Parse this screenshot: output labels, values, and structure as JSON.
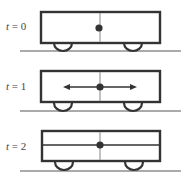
{
  "diagram": {
    "panels": [
      {
        "time_var": "t",
        "eq": " = ",
        "value": "0",
        "state": "at-rest"
      },
      {
        "time_var": "t",
        "eq": " = ",
        "value": "1",
        "state": "bidirectional-arrows"
      },
      {
        "time_var": "t",
        "eq": " = ",
        "value": "2",
        "state": "horizontal-line"
      }
    ],
    "colors": {
      "box_stroke": "#333333",
      "divider": "#999999",
      "ground": "#aaaaaa",
      "dot": "#333333"
    }
  }
}
